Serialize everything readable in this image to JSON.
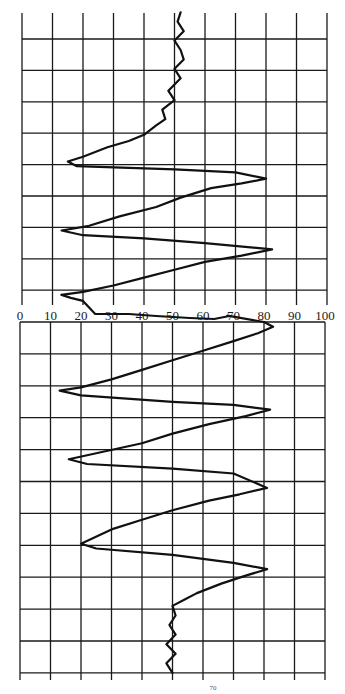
{
  "chart_data": {
    "type": "line",
    "title": "",
    "xlabel": "",
    "ylabel": "",
    "orientation": "vertical trace (x = value, y = time/sample going down)",
    "xlim": [
      0,
      100
    ],
    "x_ticks": [
      0,
      10,
      20,
      30,
      40,
      50,
      60,
      70,
      80,
      90,
      100
    ],
    "x_tick_labels": [
      "0",
      "10",
      "20",
      "30",
      "40",
      "50",
      "60",
      "70",
      "80",
      "90",
      "100"
    ],
    "grid": true,
    "legend": null,
    "panels": [
      {
        "name": "upper",
        "rows": 9,
        "series": [
          {
            "name": "trace-upper",
            "points_percent_vs_row": [
              [
                52,
                0.0
              ],
              [
                51,
                0.3
              ],
              [
                53,
                0.6
              ],
              [
                50,
                0.9
              ],
              [
                52,
                1.2
              ],
              [
                53,
                1.5
              ],
              [
                50,
                1.8
              ],
              [
                52,
                2.1
              ],
              [
                48,
                2.5
              ],
              [
                50,
                2.8
              ],
              [
                46,
                3.1
              ],
              [
                47,
                3.4
              ],
              [
                44,
                3.6
              ],
              [
                40,
                3.9
              ],
              [
                35,
                4.1
              ],
              [
                28,
                4.3
              ],
              [
                20,
                4.6
              ],
              [
                15,
                4.75
              ],
              [
                18,
                4.9
              ],
              [
                50,
                5.0
              ],
              [
                70,
                5.1
              ],
              [
                80,
                5.3
              ],
              [
                72,
                5.45
              ],
              [
                62,
                5.6
              ],
              [
                52,
                5.9
              ],
              [
                44,
                6.2
              ],
              [
                32,
                6.5
              ],
              [
                22,
                6.8
              ],
              [
                13,
                6.95
              ],
              [
                20,
                7.1
              ],
              [
                40,
                7.2
              ],
              [
                60,
                7.35
              ],
              [
                82,
                7.55
              ],
              [
                72,
                7.75
              ],
              [
                60,
                7.95
              ],
              [
                50,
                8.2
              ],
              [
                40,
                8.45
              ],
              [
                30,
                8.7
              ],
              [
                20,
                8.9
              ],
              [
                13,
                9.0
              ]
            ]
          }
        ]
      },
      {
        "name": "lower",
        "rows": 11,
        "series": [
          {
            "name": "trace-lower",
            "points_percent_vs_row": [
              [
                68,
                -0.2
              ],
              [
                80,
                0.0
              ],
              [
                83,
                0.15
              ],
              [
                78,
                0.35
              ],
              [
                70,
                0.6
              ],
              [
                60,
                0.9
              ],
              [
                50,
                1.2
              ],
              [
                40,
                1.5
              ],
              [
                30,
                1.8
              ],
              [
                20,
                2.05
              ],
              [
                13,
                2.15
              ],
              [
                20,
                2.3
              ],
              [
                50,
                2.5
              ],
              [
                70,
                2.6
              ],
              [
                82,
                2.75
              ],
              [
                74,
                2.95
              ],
              [
                62,
                3.2
              ],
              [
                50,
                3.5
              ],
              [
                40,
                3.8
              ],
              [
                28,
                4.05
              ],
              [
                16,
                4.3
              ],
              [
                22,
                4.45
              ],
              [
                50,
                4.6
              ],
              [
                70,
                4.75
              ],
              [
                81,
                5.2
              ],
              [
                72,
                5.4
              ],
              [
                62,
                5.6
              ],
              [
                50,
                5.9
              ],
              [
                40,
                6.2
              ],
              [
                30,
                6.5
              ],
              [
                20,
                6.95
              ],
              [
                25,
                7.1
              ],
              [
                50,
                7.3
              ],
              [
                70,
                7.55
              ],
              [
                81,
                7.75
              ],
              [
                74,
                7.95
              ],
              [
                66,
                8.2
              ],
              [
                58,
                8.5
              ],
              [
                54,
                8.7
              ],
              [
                50,
                8.9
              ],
              [
                51,
                9.2
              ],
              [
                49,
                9.5
              ],
              [
                51,
                9.8
              ],
              [
                48,
                10.1
              ],
              [
                51,
                10.4
              ],
              [
                48,
                10.7
              ],
              [
                50,
                11.0
              ]
            ]
          }
        ]
      }
    ],
    "turning_points": {
      "upper": {
        "minima": [
          15,
          13,
          13
        ],
        "maxima": [
          80,
          82
        ]
      },
      "lower": {
        "minima": [
          13,
          16,
          20
        ],
        "maxima": [
          83,
          82,
          81,
          81
        ]
      }
    }
  },
  "layout": {
    "x0_px": 22,
    "x100_px": 327,
    "upper": {
      "top_px": 13,
      "first_line_px": 39,
      "row_px": 31.4,
      "bottom_px": 291,
      "vline_bottom_px": 305
    },
    "axis_label_y_px": 320,
    "lower": {
      "top_px": 322,
      "row_px": 31.9,
      "bottom_px": 673,
      "vline_bottom_px": 680
    }
  },
  "page_mark": "70"
}
